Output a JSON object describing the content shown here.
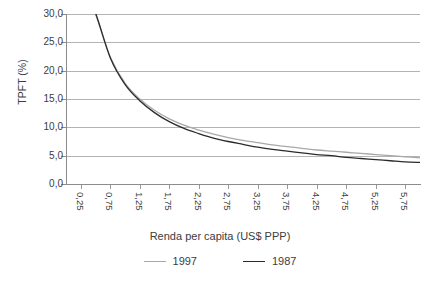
{
  "chart_data": {
    "type": "line",
    "title": "",
    "xlabel": "Renda per capita (US$ PPP)",
    "ylabel": "TPFT (%)",
    "xlim": [
      0.0,
      6.0
    ],
    "ylim": [
      0.0,
      30.0
    ],
    "grid": true,
    "legend_position": "bottom",
    "x_tick_labels": [
      "0,25",
      "0,75",
      "1,25",
      "1,75",
      "2,25",
      "2,75",
      "3,25",
      "3,75",
      "4,25",
      "4,75",
      "5,25",
      "5,75"
    ],
    "x_tick_values": [
      0.25,
      0.75,
      1.25,
      1.75,
      2.25,
      2.75,
      3.25,
      3.75,
      4.25,
      4.75,
      5.25,
      5.75
    ],
    "y_tick_labels": [
      "0,0",
      "5,0",
      "10,0",
      "15,0",
      "20,0",
      "25,0",
      "30,0"
    ],
    "y_tick_values": [
      0,
      5,
      10,
      15,
      20,
      25,
      30
    ],
    "x": [
      0.25,
      0.5,
      0.75,
      1.0,
      1.25,
      1.5,
      1.75,
      2.0,
      2.25,
      2.5,
      2.75,
      3.0,
      3.25,
      3.5,
      3.75,
      4.0,
      4.25,
      4.5,
      4.75,
      5.0,
      5.25,
      5.5,
      5.75,
      6.0
    ],
    "series": [
      {
        "name": "1997",
        "color": "#a8a8a8",
        "values": [
          36.0,
          30.0,
          22.4,
          17.8,
          15.0,
          13.0,
          11.5,
          10.4,
          9.5,
          8.8,
          8.2,
          7.7,
          7.3,
          6.9,
          6.6,
          6.3,
          6.0,
          5.8,
          5.6,
          5.4,
          5.2,
          5.0,
          4.8,
          4.6
        ]
      },
      {
        "name": "1987",
        "color": "#2b2b2b",
        "values": [
          36.5,
          30.2,
          22.3,
          17.6,
          14.7,
          12.6,
          11.0,
          9.8,
          8.9,
          8.1,
          7.5,
          7.0,
          6.5,
          6.1,
          5.8,
          5.5,
          5.2,
          5.0,
          4.7,
          4.5,
          4.3,
          4.1,
          3.9,
          3.8
        ]
      }
    ]
  },
  "legend": {
    "items": [
      {
        "label": "1997",
        "color": "#a8a8a8"
      },
      {
        "label": "1987",
        "color": "#2b2b2b"
      }
    ]
  },
  "axes": {
    "y_title": "TPFT (%)",
    "x_title": "Renda per capita (US$ PPP)"
  }
}
